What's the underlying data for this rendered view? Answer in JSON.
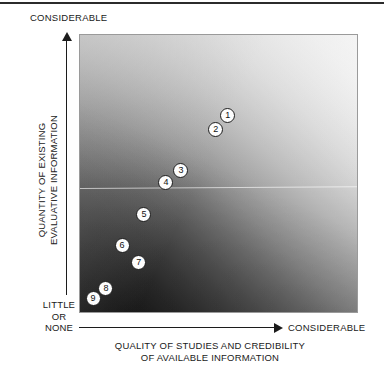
{
  "chart_data": {
    "type": "scatter",
    "title": "",
    "xlabel": "QUALITY OF STUDIES AND CREDIBILITY OF AVAILABLE INFORMATION",
    "ylabel": "QUANTITY OF EXISTING EVALUATIVE INFORMATION",
    "xlabel_lines": [
      "QUALITY OF STUDIES AND CREDIBILITY",
      "OF AVAILABLE INFORMATION"
    ],
    "ylabel_lines": [
      "QUANTITY OF EXISTING",
      "EVALUATIVE INFORMATION"
    ],
    "x_axis_low_label": "",
    "x_axis_high_label": "CONSIDERABLE",
    "y_axis_low_label": "LITTLE OR NONE",
    "y_axis_low_label_lines": [
      "LITTLE",
      "OR",
      "NONE"
    ],
    "y_axis_high_label": "CONSIDERABLE",
    "xlim": [
      0,
      100
    ],
    "ylim": [
      0,
      100
    ],
    "grid": false,
    "legend": "none",
    "background": "diagonal grayscale gradient, dark at lower-left, white at upper-right",
    "points": [
      {
        "label": "1",
        "x": 53.0,
        "y": 71.3
      },
      {
        "label": "2",
        "x": 48.7,
        "y": 66.3
      },
      {
        "label": "3",
        "x": 36.2,
        "y": 51.3
      },
      {
        "label": "4",
        "x": 30.8,
        "y": 47.0
      },
      {
        "label": "5",
        "x": 22.9,
        "y": 35.8
      },
      {
        "label": "6",
        "x": 15.1,
        "y": 24.4
      },
      {
        "label": "7",
        "x": 21.1,
        "y": 18.3
      },
      {
        "label": "8",
        "x": 9.3,
        "y": 9.3
      },
      {
        "label": "9",
        "x": 4.7,
        "y": 5.4
      }
    ]
  },
  "axes": {
    "y_top": "CONSIDERABLE",
    "y_bottom_line1": "LITTLE",
    "y_bottom_line2": "OR",
    "y_bottom_line3": "NONE",
    "y_title_line1": "QUANTITY OF EXISTING",
    "y_title_line2": "EVALUATIVE INFORMATION",
    "x_right": "CONSIDERABLE",
    "x_title_line1": "QUALITY OF STUDIES AND CREDIBILITY",
    "x_title_line2": "OF AVAILABLE INFORMATION"
  },
  "colors": {
    "ink": "#1a1a1a",
    "panel_border": "#9a9a9a",
    "marker_fill": "#fdfdfd",
    "marker_stroke": "#1c1c1c",
    "gradient_dark": "#141414",
    "gradient_light": "#ffffff"
  }
}
